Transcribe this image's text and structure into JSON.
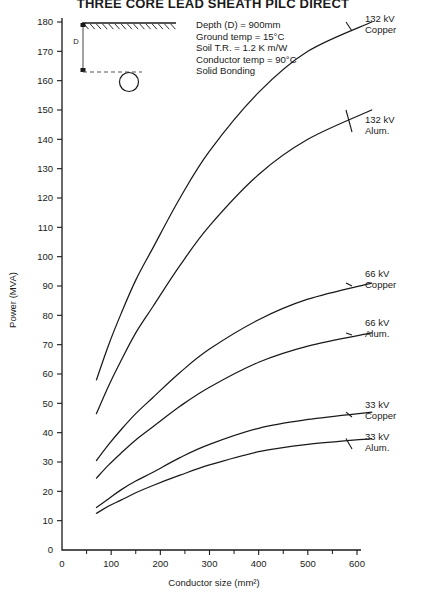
{
  "title": "THREE CORE LEAD SHEATH PILC DIRECT",
  "notes": [
    "Depth (D)  =  900mm",
    "Ground temp  =  15°C",
    "Soil T.R.  =  1.2 K  m/W",
    "Conductor temp  =  90°C",
    "Solid Bonding"
  ],
  "inset": {
    "depth_label": "D",
    "ground_icon": "hatched-ground-surface",
    "cable_icon": "buried-cable-circle"
  },
  "chart_data": {
    "type": "line",
    "title": "THREE CORE LEAD SHEATH PILC DIRECT",
    "xlabel": "Conductor size (mm²)",
    "ylabel": "Power (MVA)",
    "xlim": [
      0,
      630
    ],
    "ylim": [
      0,
      180
    ],
    "xticks": [
      0,
      100,
      200,
      300,
      400,
      500,
      600
    ],
    "xticks_minor": [
      50,
      150,
      250,
      350,
      450,
      550
    ],
    "yticks": [
      0,
      10,
      20,
      30,
      40,
      50,
      60,
      70,
      80,
      90,
      100,
      110,
      120,
      130,
      140,
      150,
      160,
      170,
      180
    ],
    "grid": false,
    "legend": "inline-right-labels",
    "x": [
      70,
      95,
      120,
      150,
      185,
      240,
      300,
      400,
      500,
      630
    ],
    "series": [
      {
        "name": "132 kV Copper",
        "label_lines": [
          "132 kV",
          "Copper"
        ],
        "values": [
          58,
          70,
          80.5,
          92,
          103,
          120,
          136,
          156,
          170,
          180
        ]
      },
      {
        "name": "132 kV Alum.",
        "label_lines": [
          "132 kV",
          "Alum."
        ],
        "values": [
          46.5,
          56,
          64.5,
          74,
          83,
          97,
          110.5,
          128,
          140,
          150
        ]
      },
      {
        "name": "66 kV Copper",
        "label_lines": [
          "66 kV",
          "Copper"
        ],
        "values": [
          30.5,
          36,
          41,
          46.5,
          52,
          60.5,
          68.5,
          78.5,
          85.5,
          91
        ]
      },
      {
        "name": "66 kV Alum.",
        "label_lines": [
          "66 kV",
          "Alum."
        ],
        "values": [
          24.5,
          29,
          33,
          37.5,
          42,
          49,
          55.5,
          64,
          69.5,
          74
        ]
      },
      {
        "name": "33 kV Copper",
        "label_lines": [
          "33 kV",
          "Copper"
        ],
        "values": [
          14.5,
          17.5,
          20.5,
          23.5,
          26.5,
          31.5,
          36,
          41.5,
          44.5,
          47
        ]
      },
      {
        "name": "33 kV Alum.",
        "label_lines": [
          "33 kV",
          "Alum."
        ],
        "values": [
          12.5,
          15,
          17,
          19.5,
          22,
          25.5,
          29,
          33.5,
          36,
          38
        ]
      }
    ]
  }
}
